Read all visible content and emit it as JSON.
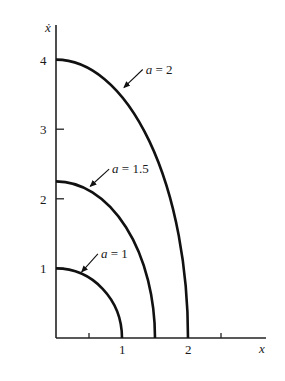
{
  "chart_data": {
    "type": "line",
    "title": "",
    "xlabel": "x",
    "ylabel": "ẋ",
    "xlim": [
      0,
      2.35
    ],
    "ylim": [
      0,
      4.4
    ],
    "x_ticks": [
      0.5,
      1,
      1.5,
      2,
      2.5
    ],
    "x_tick_labels": [
      {
        "value": 1,
        "label": "1"
      },
      {
        "value": 2,
        "label": "2"
      }
    ],
    "y_ticks": [
      1,
      2,
      3,
      4
    ],
    "y_tick_labels": [
      {
        "value": 1,
        "label": "1"
      },
      {
        "value": 2,
        "label": "2"
      },
      {
        "value": 3,
        "label": "3"
      },
      {
        "value": 4,
        "label": "4"
      }
    ],
    "grid": false,
    "legend": "none (inline annotations with arrows)",
    "series": [
      {
        "name": "a = 1",
        "a": 1,
        "x_intercept": 1,
        "y_intercept": 1,
        "annotation": {
          "text": "a = 1",
          "label_at": [
            0.68,
            1.15
          ],
          "arrow_to": [
            0.39,
            0.95
          ]
        }
      },
      {
        "name": "a = 1.5",
        "a": 1.5,
        "x_intercept": 1.5,
        "y_intercept": 2.25,
        "annotation": {
          "text": "a = 1.5",
          "label_at": [
            0.85,
            2.37
          ],
          "arrow_to": [
            0.52,
            2.18
          ]
        }
      },
      {
        "name": "a = 2",
        "a": 2,
        "x_intercept": 2,
        "y_intercept": 4,
        "annotation": {
          "text": "a = 2",
          "label_at": [
            1.36,
            3.8
          ],
          "arrow_to": [
            1.03,
            3.6
          ]
        }
      }
    ]
  },
  "labels": {
    "x_axis": "x",
    "y_axis": "ẋ",
    "series_annotations": [
      {
        "italic": "a",
        "rest": " = 2"
      },
      {
        "italic": "a",
        "rest": " = 1.5"
      },
      {
        "italic": "a",
        "rest": " = 1"
      }
    ]
  },
  "style": {
    "line_color": "#111111",
    "axis_color": "#222222",
    "background": "#ffffff"
  }
}
